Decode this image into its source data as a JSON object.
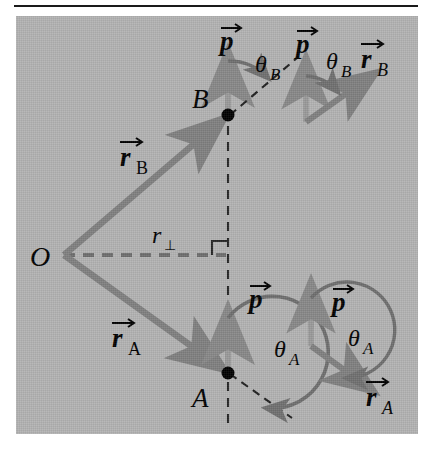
{
  "figure": {
    "type": "physics-vector-diagram",
    "background_color": "#b3b3b3",
    "vector_color": "#808080",
    "label_color": "#000000",
    "rule_color": "#1a1a1a"
  },
  "labels": {
    "origin": "O",
    "point_b": "B",
    "point_a": "A",
    "momentum_b": "p",
    "momentum_a": "p",
    "momentum_inset_b": "p",
    "momentum_inset_a": "p",
    "position_b": "r",
    "position_b_sub": "B",
    "position_a": "r",
    "position_a_sub": "A",
    "position_inset_b": "r",
    "position_inset_b_sub": "B",
    "position_inset_a": "r",
    "position_inset_a_sub": "A",
    "theta_b": "θ",
    "theta_b_sub": "B",
    "theta_a": "θ",
    "theta_a_sub": "A",
    "theta_inset_b": "θ",
    "theta_inset_b_sub": "B",
    "theta_inset_a": "θ",
    "theta_inset_a_sub": "A",
    "perp_distance": "r",
    "perp_distance_sub": "⊥"
  },
  "geometry": {
    "origin": {
      "x": 63,
      "y": 255
    },
    "point_b": {
      "x": 229,
      "y": 116
    },
    "point_a": {
      "x": 229,
      "y": 373
    },
    "vertical_dashed_line": {
      "x": 229,
      "y_top": 110,
      "y_bottom": 430
    },
    "perp_line": {
      "x1": 63,
      "y1": 255,
      "x2": 229,
      "y2": 255
    },
    "right_angle_marker": {
      "x": 229,
      "y": 255,
      "size": 12
    },
    "theta_b_degrees": 48,
    "theta_a_degrees": 131,
    "momentum_arrow_b": {
      "from_y": 116,
      "to_y": 50
    },
    "momentum_arrow_a": {
      "from_y": 373,
      "to_y": 307
    },
    "inset_b": {
      "origin_x": 306,
      "origin_y": 117,
      "p_tip_y": 55,
      "r_angle_degrees": 48
    },
    "inset_a": {
      "origin_x": 311,
      "origin_y": 320,
      "p_tip_y": 308,
      "r_angle_degrees": 131
    }
  }
}
